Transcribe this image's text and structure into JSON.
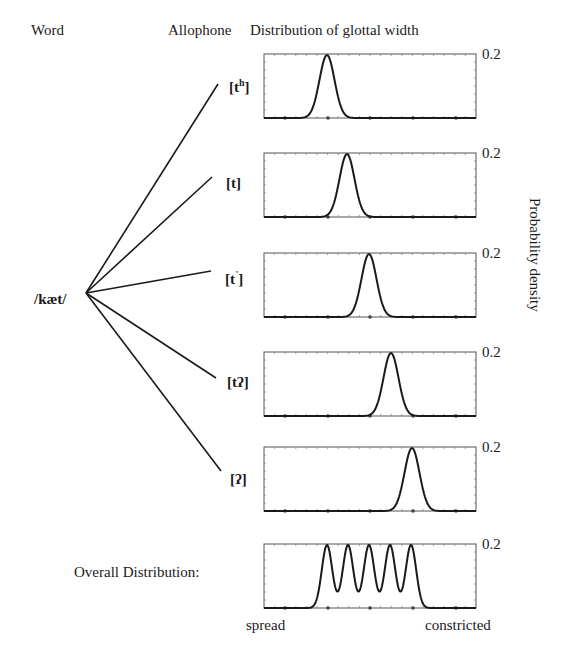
{
  "header": {
    "word_label": "Word",
    "allophone_label": "Allophone",
    "distribution_label": "Distribution of glottal width"
  },
  "word": {
    "text": "/kæt/",
    "origin": [
      86,
      293
    ]
  },
  "y_axis_label": "Probability density",
  "y_max_label": "0.2",
  "x_axis": {
    "left_label": "spread",
    "right_label": "constricted"
  },
  "overall_label": "Overall Distribution:",
  "plot_geometry": {
    "left": 264,
    "right": 476,
    "height": 64,
    "dots_x": [
      285,
      328,
      370,
      413,
      456
    ]
  },
  "allophones": [
    {
      "label_base": "[t",
      "label_sup": "h",
      "label_tail": "]",
      "line_end": [
        218,
        84
      ],
      "label_x": 229,
      "label_y": 92,
      "plot_top": 54,
      "peak_x": 327
    },
    {
      "label_base": "[t",
      "label_sup": "",
      "label_tail": "]",
      "line_end": [
        212,
        177
      ],
      "label_x": 226,
      "label_y": 188,
      "plot_top": 153,
      "peak_x": 347
    },
    {
      "label_base": "[t",
      "label_sup": "˺",
      "label_tail": "]",
      "line_end": [
        211,
        271
      ],
      "label_x": 225,
      "label_y": 284,
      "plot_top": 253,
      "peak_x": 369
    },
    {
      "label_base": "[tʔ",
      "label_sup": "",
      "label_tail": "]",
      "line_end": [
        216,
        378
      ],
      "label_x": 227,
      "label_y": 387,
      "plot_top": 352,
      "peak_x": 391
    },
    {
      "label_base": "[ʔ",
      "label_sup": "",
      "label_tail": "]",
      "line_end": [
        221,
        471
      ],
      "label_x": 230,
      "label_y": 484,
      "plot_top": 447,
      "peak_x": 412
    }
  ],
  "overall_plot": {
    "plot_top": 544,
    "peaks_x": [
      327,
      348,
      369,
      390,
      411
    ]
  },
  "chart_data": {
    "type": "line",
    "title": "Distribution of glottal width",
    "xlabel": "glottal width (spread → constricted)",
    "ylabel": "Probability density",
    "ylim": [
      0,
      0.2
    ],
    "x_tick_labels": [
      "spread",
      "constricted"
    ],
    "series": [
      {
        "name": "[tʰ]",
        "peak_position": 0.3,
        "peak_density": 0.2
      },
      {
        "name": "[t]",
        "peak_position": 0.39,
        "peak_density": 0.2
      },
      {
        "name": "[t˺]",
        "peak_position": 0.5,
        "peak_density": 0.2
      },
      {
        "name": "[tʔ]",
        "peak_position": 0.6,
        "peak_density": 0.2
      },
      {
        "name": "[ʔ]",
        "peak_position": 0.7,
        "peak_density": 0.2
      },
      {
        "name": "Overall Distribution",
        "peak_positions": [
          0.3,
          0.39,
          0.5,
          0.6,
          0.7
        ],
        "peak_density": 0.2,
        "valley_density": 0.08
      }
    ]
  }
}
